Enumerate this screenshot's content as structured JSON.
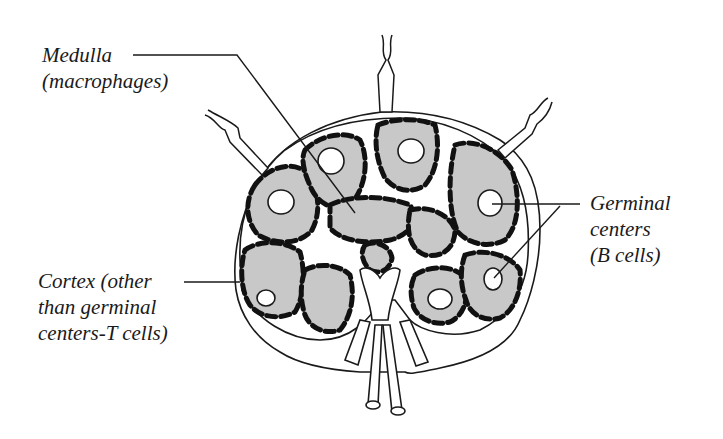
{
  "diagram": {
    "colors": {
      "outline": "#1a1a1a",
      "follicle_fill": "#c8c8c8",
      "background": "#ffffff"
    },
    "labels": {
      "medulla": {
        "line1": "Medulla",
        "line2": "(macrophages)"
      },
      "cortex": {
        "line1": "Cortex (other",
        "line2": "than germinal",
        "line3": "centers-T cells)"
      },
      "germinal": {
        "line1": "Germinal",
        "line2": "centers",
        "line3": "(B cells)"
      }
    }
  }
}
